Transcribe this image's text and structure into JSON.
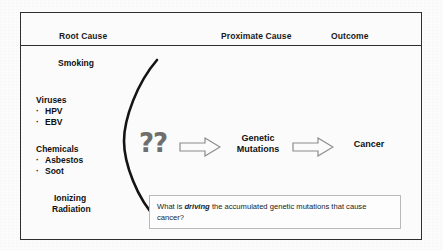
{
  "diagram": {
    "headers": {
      "root": "Root Cause",
      "proximate": "Proximate Cause",
      "outcome": "Outcome"
    },
    "root_causes": {
      "smoking": "Smoking",
      "viruses_group": "Viruses",
      "virus_1": "HPV",
      "virus_2": "EBV",
      "chemicals_group": "Chemicals",
      "chemical_1": "Asbestos",
      "chemical_2": "Soot",
      "radiation_line1": "Ionizing",
      "radiation_line2": "Radiation",
      "bullet_glyph": "·"
    },
    "flow": {
      "unknown_mechanism": "??",
      "proximate_line1": "Genetic",
      "proximate_line2": "Mutations",
      "outcome": "Cancer"
    },
    "caption": {
      "part1": "What is ",
      "emphasis": "driving",
      "part2": " the accumulated genetic mutations that cause cancer?"
    },
    "colors": {
      "frame_border": "#2f2f2f",
      "text": "#111111",
      "question_mark": "#6e6e6e",
      "arrow_stroke": "#8c8c8c",
      "arrow_fill": "#fbfbfb",
      "caption_border": "#b9b9b9",
      "background": "#fbfbfb"
    }
  }
}
